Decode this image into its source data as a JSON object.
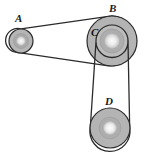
{
  "figure": {
    "kind": "belt-and-pulley-diagram",
    "width": 146,
    "height": 159,
    "background_color": "#ffffff",
    "labels": {
      "a": "A",
      "b": "B",
      "c": "C",
      "d": "D"
    },
    "colors": {
      "outline": "#2b2b2b",
      "belt": "#2b2b2b",
      "pulley_body": "#b0b0b0",
      "pulley_body_light": "#bdbdbd",
      "hub_ring": "#a0a0a0",
      "hub_center": "#f2f2f2",
      "label_text": "#1a1a1a"
    },
    "pulleys": [
      {
        "name": "A",
        "label": "A",
        "cx": 21,
        "cy": 41,
        "radius": 12,
        "hub_radius": 5,
        "role": "small-left-pulley"
      },
      {
        "name": "B",
        "label": "B",
        "cx": 112,
        "cy": 41,
        "radius": 25,
        "hub_radius": 8,
        "role": "large-upper-right-pulley"
      },
      {
        "name": "C",
        "label": "C",
        "cx": 112,
        "cy": 41,
        "radius": 16,
        "hub_radius": 8,
        "role": "inner-pulley-on-shaft-B"
      },
      {
        "name": "D",
        "label": "D",
        "cx": 110,
        "cy": 128,
        "radius": 20,
        "hub_radius": 7,
        "role": "lower-right-pulley"
      }
    ],
    "belts": [
      {
        "name": "belt-A-B",
        "connects": [
          "A",
          "B"
        ],
        "description": "open belt from small pulley A to large pulley B"
      },
      {
        "name": "belt-C-D",
        "connects": [
          "C",
          "D"
        ],
        "description": "open belt from inner pulley C down to pulley D"
      }
    ]
  }
}
